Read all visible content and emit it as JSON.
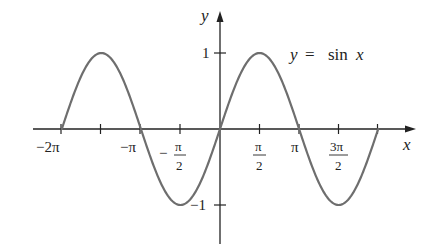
{
  "chart_data": {
    "type": "line",
    "title": "",
    "annotation": "y = sin x",
    "annotation_parts": {
      "y": "y",
      "eq": "=",
      "fn": "sin",
      "x": "x"
    },
    "xlabel": "x",
    "ylabel": "y",
    "xlim": [
      -6.6,
      6.9
    ],
    "ylim": [
      -1.5,
      1.5
    ],
    "grid": false,
    "legend": "none",
    "series": [
      {
        "name": "y = sin x",
        "function": "sin(x)",
        "domain": [
          -6.2832,
          6.2832
        ],
        "color": "#6e6e6e"
      }
    ],
    "x_ticks": [
      {
        "value": -6.2832,
        "label": "−2π"
      },
      {
        "value": -4.7124,
        "label": ""
      },
      {
        "value": -3.1416,
        "label": "−π"
      },
      {
        "value": -1.5708,
        "label": "−π/2",
        "num": "π",
        "den": "2",
        "sign": "−"
      },
      {
        "value": 1.5708,
        "label": "π/2",
        "num": "π",
        "den": "2"
      },
      {
        "value": 3.1416,
        "label": "π"
      },
      {
        "value": 4.7124,
        "label": "3π/2",
        "num": "3π",
        "den": "2"
      },
      {
        "value": 6.2832,
        "label": ""
      }
    ],
    "y_ticks": [
      {
        "value": 1,
        "label": "1"
      },
      {
        "value": -1,
        "label": "−1"
      }
    ],
    "sample_points": {
      "x": [
        -6.2832,
        -4.7124,
        -3.1416,
        -1.5708,
        0,
        1.5708,
        3.1416,
        4.7124,
        6.2832
      ],
      "y": [
        0,
        1,
        0,
        -1,
        0,
        1,
        0,
        -1,
        0
      ]
    }
  },
  "labels": {
    "x_axis": "x",
    "y_axis": "y",
    "y_one": "1",
    "y_neg_one": "−1",
    "tick_neg2pi": "−2π",
    "tick_negpi": "−π",
    "tick_neghalfpi_sign": "−",
    "tick_neghalfpi_num": "π",
    "tick_neghalfpi_den": "2",
    "tick_halfpi_num": "π",
    "tick_halfpi_den": "2",
    "tick_pi": "π",
    "tick_3halfpi_num": "3π",
    "tick_3halfpi_den": "2",
    "eq_y": "y",
    "eq_sign": "=",
    "eq_fn": "sin",
    "eq_x": "x"
  }
}
